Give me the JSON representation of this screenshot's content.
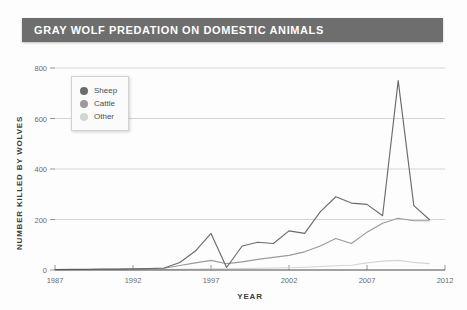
{
  "title": "GRAY WOLF PREDATION ON DOMESTIC ANIMALS",
  "colors": {
    "title_bar": "#6e6e6e",
    "sheep": "#6b6b6b",
    "cattle": "#9a9a9a",
    "other": "#d5d5d5",
    "gridline": "#c9c9c9",
    "axis": "#4a4a4a"
  },
  "legend": {
    "position": "top-left-inside",
    "items": [
      {
        "label": "Sheep",
        "color": "#6b6b6b"
      },
      {
        "label": "Cattle",
        "color": "#9a9a9a"
      },
      {
        "label": "Other",
        "color": "#d5d5d5"
      }
    ]
  },
  "chart_data": {
    "type": "line",
    "title": "GRAY WOLF PREDATION ON DOMESTIC ANIMALS",
    "xlabel": "YEAR",
    "ylabel": "NUMBER KILLED BY WOLVES",
    "xlim": [
      1987,
      2012
    ],
    "ylim": [
      0,
      800
    ],
    "grid": true,
    "xticks": [
      1987,
      1992,
      1997,
      2002,
      2007,
      2012
    ],
    "yticks": [
      0,
      200,
      400,
      600,
      800
    ],
    "x": [
      1987,
      1988,
      1989,
      1990,
      1991,
      1992,
      1993,
      1994,
      1995,
      1996,
      1997,
      1998,
      1999,
      2000,
      2001,
      2002,
      2003,
      2004,
      2005,
      2006,
      2007,
      2008,
      2009,
      2010,
      2011
    ],
    "series": [
      {
        "name": "Sheep",
        "color": "#6b6b6b",
        "values": [
          2,
          3,
          3,
          4,
          4,
          5,
          6,
          8,
          30,
          75,
          145,
          10,
          95,
          110,
          105,
          155,
          145,
          230,
          290,
          265,
          260,
          215,
          750,
          255,
          200
        ]
      },
      {
        "name": "Cattle",
        "color": "#9a9a9a",
        "values": [
          1,
          2,
          2,
          3,
          3,
          4,
          5,
          7,
          18,
          28,
          38,
          25,
          32,
          42,
          50,
          58,
          72,
          95,
          125,
          105,
          150,
          185,
          205,
          195,
          195
        ]
      },
      {
        "name": "Other",
        "color": "#d5d5d5",
        "values": [
          0,
          0,
          1,
          1,
          1,
          1,
          2,
          2,
          3,
          4,
          5,
          5,
          6,
          7,
          8,
          9,
          11,
          14,
          17,
          19,
          28,
          35,
          38,
          30,
          25
        ]
      }
    ]
  }
}
